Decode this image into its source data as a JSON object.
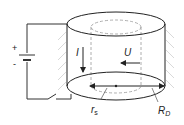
{
  "diagram": {
    "type": "physics-schematic",
    "battery": {
      "plus": "+",
      "minus": "-"
    },
    "labels": {
      "current": "I",
      "voltage": "U",
      "inner_radius": "r",
      "inner_radius_sub": "s",
      "outer_radius": "R",
      "outer_radius_sub": "D"
    },
    "colors": {
      "line": "#222222",
      "dashed": "#999999",
      "hatch": "#cccccc",
      "background": "#ffffff"
    }
  }
}
